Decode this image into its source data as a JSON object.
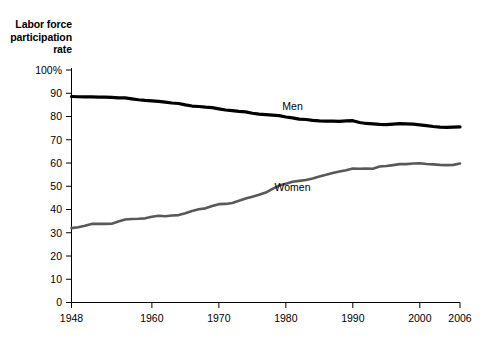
{
  "chart_data": {
    "type": "line",
    "title": "",
    "ylabel": "Labor force\nparticipation\nrate",
    "xlabel": "",
    "ylim": [
      0,
      100
    ],
    "xlim": [
      1948,
      2006
    ],
    "grid": false,
    "legend_position": "inline-annotation",
    "y_ticks": [
      "100%",
      "90",
      "80",
      "70",
      "60",
      "50",
      "40",
      "30",
      "20",
      "10",
      "0"
    ],
    "y_tick_values": [
      100,
      90,
      80,
      70,
      60,
      50,
      40,
      30,
      20,
      10,
      0
    ],
    "x_ticks": [
      "1948",
      "1960",
      "1970",
      "1980",
      "1990",
      "2000",
      "2006"
    ],
    "x_tick_values": [
      1948,
      1960,
      1970,
      1980,
      1990,
      2000,
      2006
    ],
    "x": [
      1948,
      1949,
      1950,
      1951,
      1952,
      1953,
      1954,
      1955,
      1956,
      1957,
      1958,
      1959,
      1960,
      1961,
      1962,
      1963,
      1964,
      1965,
      1966,
      1967,
      1968,
      1969,
      1970,
      1971,
      1972,
      1973,
      1974,
      1975,
      1976,
      1977,
      1978,
      1979,
      1980,
      1981,
      1982,
      1983,
      1984,
      1985,
      1986,
      1987,
      1988,
      1989,
      1990,
      1991,
      1992,
      1993,
      1994,
      1995,
      1996,
      1997,
      1998,
      1999,
      2000,
      2001,
      2002,
      2003,
      2004,
      2005,
      2006
    ],
    "series": [
      {
        "name": "Men",
        "color": "#000000",
        "label_x": 1981,
        "label_y": 83,
        "values": [
          88.6,
          88.5,
          88.4,
          88.4,
          88.3,
          88.3,
          88.2,
          88.0,
          88.0,
          87.6,
          87.2,
          86.9,
          86.7,
          86.5,
          86.2,
          85.8,
          85.6,
          85.0,
          84.5,
          84.3,
          84.0,
          83.8,
          83.3,
          82.8,
          82.5,
          82.2,
          82.0,
          81.4,
          81.0,
          80.8,
          80.6,
          80.4,
          79.8,
          79.4,
          78.9,
          78.7,
          78.3,
          78.1,
          78.0,
          78.0,
          77.9,
          78.1,
          78.2,
          77.4,
          77.0,
          76.8,
          76.6,
          76.5,
          76.7,
          76.9,
          76.8,
          76.7,
          76.4,
          76.1,
          75.7,
          75.4,
          75.3,
          75.4,
          75.5
        ]
      },
      {
        "name": "Women",
        "color": "#595959",
        "label_x": 1981,
        "label_y": 48,
        "values": [
          32.0,
          32.4,
          33.0,
          33.8,
          33.9,
          33.8,
          33.9,
          34.8,
          35.7,
          35.9,
          36.0,
          36.2,
          36.9,
          37.3,
          37.1,
          37.4,
          37.6,
          38.4,
          39.4,
          40.1,
          40.5,
          41.5,
          42.3,
          42.4,
          42.8,
          43.8,
          44.7,
          45.5,
          46.3,
          47.3,
          48.9,
          50.3,
          51.1,
          51.9,
          52.3,
          52.7,
          53.3,
          54.2,
          54.9,
          55.7,
          56.3,
          56.9,
          57.6,
          57.5,
          57.6,
          57.5,
          58.5,
          58.7,
          59.1,
          59.5,
          59.5,
          59.8,
          59.9,
          59.6,
          59.4,
          59.2,
          59.1,
          59.2,
          59.8
        ]
      }
    ]
  },
  "axes": {
    "y_axis_title": "Labor force\nparticipation\nrate"
  }
}
